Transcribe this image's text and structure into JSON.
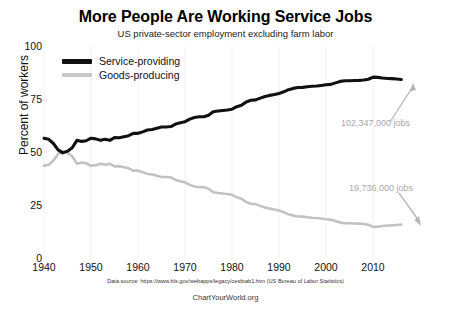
{
  "chart_data": {
    "type": "line",
    "title": "More People Are Working Service Jobs",
    "subtitle": "US private-sector employment excluding farm labor",
    "xlabel": "",
    "ylabel": "Percent of workers",
    "xlim": [
      1939,
      2016
    ],
    "ylim": [
      0,
      100
    ],
    "grid": "vertical-decades",
    "legend_position": "top-left-inside",
    "xticks": [
      "1940",
      "1950",
      "1960",
      "1970",
      "1980",
      "1990",
      "2000",
      "2010"
    ],
    "yticks": [
      "0",
      "25",
      "50",
      "75",
      "100"
    ],
    "x": [
      1939,
      1940,
      1941,
      1942,
      1943,
      1944,
      1945,
      1946,
      1947,
      1948,
      1949,
      1950,
      1951,
      1952,
      1953,
      1954,
      1955,
      1956,
      1957,
      1958,
      1959,
      1960,
      1961,
      1962,
      1963,
      1964,
      1965,
      1966,
      1967,
      1968,
      1969,
      1970,
      1971,
      1972,
      1973,
      1974,
      1975,
      1976,
      1977,
      1978,
      1979,
      1980,
      1981,
      1982,
      1983,
      1984,
      1985,
      1986,
      1987,
      1988,
      1989,
      1990,
      1991,
      1992,
      1993,
      1994,
      1995,
      1996,
      1997,
      1998,
      1999,
      2000,
      2001,
      2002,
      2003,
      2004,
      2005,
      2006,
      2007,
      2008,
      2009,
      2010,
      2011,
      2012,
      2013,
      2014,
      2015
    ],
    "series": [
      {
        "name": "Service-providing",
        "color": "#111111",
        "values": [
          56.5,
          56.0,
          54.0,
          51.0,
          49.6,
          50.4,
          52.0,
          55.5,
          55.0,
          55.3,
          56.5,
          56.2,
          55.5,
          56.0,
          55.5,
          56.8,
          56.7,
          57.2,
          57.7,
          58.8,
          58.8,
          59.5,
          60.4,
          60.6,
          61.2,
          61.8,
          61.8,
          62.0,
          63.2,
          63.8,
          64.3,
          65.5,
          66.3,
          66.6,
          66.6,
          67.3,
          69.0,
          69.3,
          69.6,
          69.8,
          70.2,
          71.4,
          72.0,
          73.6,
          74.4,
          74.6,
          75.4,
          76.2,
          76.7,
          77.1,
          77.6,
          78.4,
          79.4,
          80.0,
          80.4,
          80.5,
          80.8,
          81.0,
          81.1,
          81.4,
          81.7,
          81.9,
          82.6,
          83.3,
          83.6,
          83.6,
          83.7,
          83.8,
          84.0,
          84.3,
          85.3,
          85.2,
          84.9,
          84.7,
          84.6,
          84.4,
          84.2
        ]
      },
      {
        "name": "Goods-producing",
        "color": "#c2c2c2",
        "values": [
          43.5,
          44.0,
          46.0,
          49.0,
          50.4,
          49.6,
          48.0,
          44.5,
          45.0,
          44.7,
          43.5,
          43.8,
          44.5,
          44.0,
          44.5,
          43.2,
          43.3,
          42.8,
          42.3,
          41.2,
          41.2,
          40.5,
          39.6,
          39.4,
          38.8,
          38.2,
          38.2,
          38.0,
          36.8,
          36.2,
          35.7,
          34.5,
          33.7,
          33.4,
          33.4,
          32.7,
          31.0,
          30.7,
          30.4,
          30.2,
          29.8,
          28.6,
          28.0,
          26.4,
          25.6,
          25.4,
          24.6,
          23.8,
          23.3,
          22.9,
          22.4,
          21.6,
          20.6,
          20.0,
          19.6,
          19.5,
          19.2,
          19.0,
          18.9,
          18.6,
          18.3,
          18.1,
          17.4,
          16.7,
          16.4,
          16.4,
          16.3,
          16.2,
          16.0,
          15.7,
          14.7,
          14.8,
          15.1,
          15.3,
          15.4,
          15.6,
          15.8
        ]
      }
    ],
    "annotations": [
      {
        "name": "service-jobs-annotation",
        "text": "102,347,000 jobs",
        "color": "#a8a8a8",
        "series": "Service-providing"
      },
      {
        "name": "goods-jobs-annotation",
        "text": "19,736,000 jobs",
        "color": "#a8a8a8",
        "series": "Goods-producing"
      }
    ],
    "source_note": "Data source: https://www.bls.gov/webapps/legacy/cesbtab1.htm (US Bureau of Labor Statistics)",
    "credit": "ChartYourWorld.org"
  },
  "legend": {
    "items": [
      {
        "label": "Service-providing",
        "color": "#111111"
      },
      {
        "label": "Goods-producing",
        "color": "#c2c2c2"
      }
    ]
  },
  "axis": {
    "y_title": "Percent of workers",
    "y_ticks": [
      "100",
      "75",
      "50",
      "25",
      "0"
    ],
    "x_ticks": [
      "1940",
      "1950",
      "1960",
      "1970",
      "1980",
      "1990",
      "2000",
      "2010"
    ]
  }
}
